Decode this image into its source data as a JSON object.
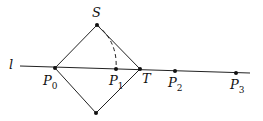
{
  "diagram": {
    "line_label": "l",
    "points": [
      {
        "id": "S",
        "label": "S",
        "sub": "",
        "x": 97,
        "y": 25
      },
      {
        "id": "P0",
        "label": "P",
        "sub": "0",
        "x": 55,
        "y": 68
      },
      {
        "id": "P1",
        "label": "P",
        "sub": "1",
        "x": 116,
        "y": 69
      },
      {
        "id": "T",
        "label": "T",
        "sub": "",
        "x": 140,
        "y": 69
      },
      {
        "id": "P2",
        "label": "P",
        "sub": "2",
        "x": 175,
        "y": 71
      },
      {
        "id": "P3",
        "label": "P",
        "sub": "3",
        "x": 236,
        "y": 73
      },
      {
        "id": "B",
        "label": "",
        "sub": "",
        "x": 96,
        "y": 113
      }
    ],
    "line_color": "#222222"
  }
}
